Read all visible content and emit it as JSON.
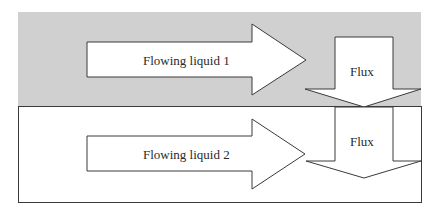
{
  "diagram": {
    "colors": {
      "upper_region_fill": "#d0d0d0",
      "lower_region_fill": "#ffffff",
      "arrow_fill": "#ffffff",
      "stroke": "#3a3a3a",
      "text": "#2a2a2a"
    },
    "upper_region": {
      "flow_arrow_label": "Flowing liquid 1",
      "flux_arrow_label": "Flux"
    },
    "lower_region": {
      "flow_arrow_label": "Flowing liquid 2",
      "flux_arrow_label": "Flux"
    }
  }
}
